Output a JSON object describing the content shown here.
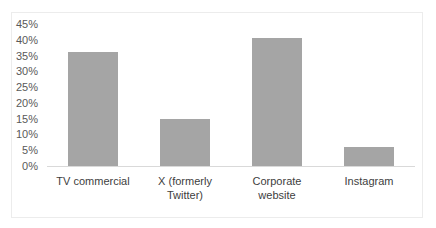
{
  "chart_data": {
    "type": "bar",
    "title": "",
    "xlabel": "",
    "ylabel": "",
    "categories": [
      "TV commercial",
      "X (formerly\nTwitter)",
      "Corporate\nwebsite",
      "Instagram"
    ],
    "values": [
      36,
      15,
      40.5,
      6
    ],
    "ylim": [
      0,
      45
    ],
    "yticks": [
      "0%",
      "5%",
      "10%",
      "15%",
      "20%",
      "25%",
      "30%",
      "35%",
      "40%",
      "45%"
    ],
    "grid": false,
    "legend": null,
    "bar_color": "#a5a5a5"
  }
}
